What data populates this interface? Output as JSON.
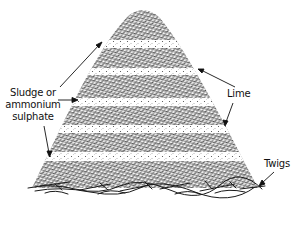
{
  "diagram": {
    "labels": {
      "sludge": {
        "line1": "Sludge or",
        "line2": "ammonium",
        "line3": "sulphate"
      },
      "lime": "Lime",
      "twigs": "Twigs"
    },
    "colors": {
      "ink": "#111111",
      "background": "#ffffff",
      "band": "#f4f4f4"
    },
    "layers": [
      {
        "type": "organic",
        "name": "top-organic-layer"
      },
      {
        "type": "band",
        "name": "sludge-band-1"
      },
      {
        "type": "organic",
        "name": "organic-layer-2"
      },
      {
        "type": "band",
        "name": "lime-band-1"
      },
      {
        "type": "organic",
        "name": "organic-layer-3"
      },
      {
        "type": "band",
        "name": "sludge-band-2"
      },
      {
        "type": "organic",
        "name": "organic-layer-4"
      },
      {
        "type": "band",
        "name": "lime-band-2"
      },
      {
        "type": "organic",
        "name": "organic-layer-5"
      },
      {
        "type": "band",
        "name": "sludge-band-3"
      },
      {
        "type": "organic",
        "name": "bottom-organic-layer"
      },
      {
        "type": "base",
        "name": "twigs-base"
      }
    ]
  }
}
